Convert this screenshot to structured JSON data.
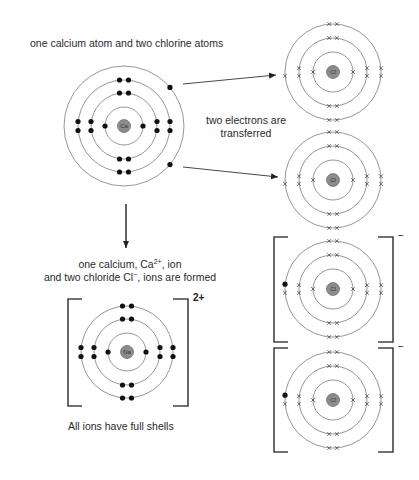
{
  "labels": {
    "top_caption": "one calcium atom and two chlorine atoms",
    "transfer_line1": "two electrons are",
    "transfer_line2": "transferred",
    "formed_line1_pre": "one calcium, Ca",
    "formed_line1_sup": "2+",
    "formed_line1_post": ", ion",
    "formed_line2_pre": "and two chloride Cl",
    "formed_line2_sup": "−",
    "formed_line2_post": ", ions are formed",
    "bottom_caption": "All ions have full shells"
  },
  "charges": {
    "calcium_ion": "2+",
    "chloride_ion_1": "−",
    "chloride_ion_2": "−"
  },
  "atoms": {
    "calcium_atom": {
      "symbol": "Ca",
      "cx": 124,
      "cy": 126,
      "shells": [
        19,
        33,
        46,
        60
      ],
      "electrons": [
        2,
        8,
        8,
        2
      ],
      "marker": "dot"
    },
    "chlorine_atom_1": {
      "symbol": "Cl",
      "cx": 333,
      "cy": 72,
      "shells": [
        20,
        34,
        48
      ],
      "electrons": [
        2,
        8,
        7
      ],
      "marker": "cross"
    },
    "chlorine_atom_2": {
      "symbol": "Cl",
      "cx": 333,
      "cy": 180,
      "shells": [
        20,
        34,
        48
      ],
      "electrons": [
        2,
        8,
        7
      ],
      "marker": "cross"
    },
    "calcium_ion": {
      "symbol": "Na",
      "cx": 127,
      "cy": 352,
      "shells": [
        19,
        33,
        46
      ],
      "electrons": [
        2,
        8,
        8
      ],
      "marker": "dot"
    },
    "chloride_ion_1": {
      "symbol": "Cl",
      "cx": 333,
      "cy": 289,
      "shells": [
        20,
        34,
        48
      ],
      "electrons": [
        2,
        8,
        8
      ],
      "marker": "cross",
      "gained": 1
    },
    "chloride_ion_2": {
      "symbol": "Cl",
      "cx": 333,
      "cy": 400,
      "shells": [
        20,
        34,
        48
      ],
      "electrons": [
        2,
        8,
        8
      ],
      "marker": "cross",
      "gained": 1
    }
  },
  "colors": {
    "shell": "#8a8a8a",
    "electron_dot": "#111111",
    "electron_cross": "#555555",
    "nucleus_fill": "#8c8c8c",
    "nucleus_stroke": "#555555",
    "bracket": "#444444",
    "arrow": "#222222"
  }
}
